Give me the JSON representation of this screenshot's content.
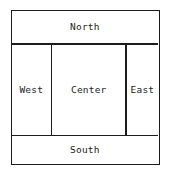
{
  "diagram": {
    "type": "border-layout-diagram",
    "colors": {
      "border": "#1c1c1c",
      "background": "#ffffff",
      "text": "#232323"
    },
    "regions": [
      {
        "id": "north",
        "label": "North",
        "position": "top"
      },
      {
        "id": "west",
        "label": "West",
        "position": "middle-left"
      },
      {
        "id": "center",
        "label": "Center",
        "position": "middle-center"
      },
      {
        "id": "east",
        "label": "East",
        "position": "middle-right"
      },
      {
        "id": "south",
        "label": "South",
        "position": "bottom"
      }
    ]
  }
}
